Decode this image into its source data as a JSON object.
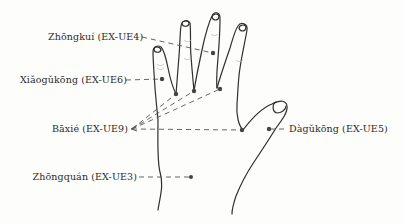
{
  "diagram": {
    "colors": {
      "outline": "#2f2f2f",
      "leader": "#555555",
      "point": "#444444",
      "background": "#fdfdfc"
    },
    "points": [
      {
        "id": "zhongkui",
        "name": "Zhōngkuí",
        "code": "EX-UE4",
        "label": "Zhōngkuí (EX-UE4)",
        "location": "middle finger, dorsal proximal interphalangeal joint"
      },
      {
        "id": "xiaogukong",
        "name": "Xiǎogǔkōng",
        "code": "EX-UE6",
        "label": "Xiǎogǔkōng (EX-UE6)",
        "location": "little finger, dorsal proximal interphalangeal joint"
      },
      {
        "id": "baxie",
        "name": "Bāxié",
        "code": "EX-UE9",
        "label": "Bāxié (EX-UE9)",
        "location": "web margins between the five fingers (4 points per hand)"
      },
      {
        "id": "dagukong",
        "name": "Dàgǔkōng",
        "code": "EX-UE5",
        "label": "Dàgǔkōng (EX-UE5)",
        "location": "thumb, dorsal interphalangeal joint"
      },
      {
        "id": "zhongquan",
        "name": "Zhōngquán",
        "code": "EX-UE3",
        "label": "Zhōngquán (EX-UE3)",
        "location": "dorsal wrist crease"
      }
    ]
  }
}
